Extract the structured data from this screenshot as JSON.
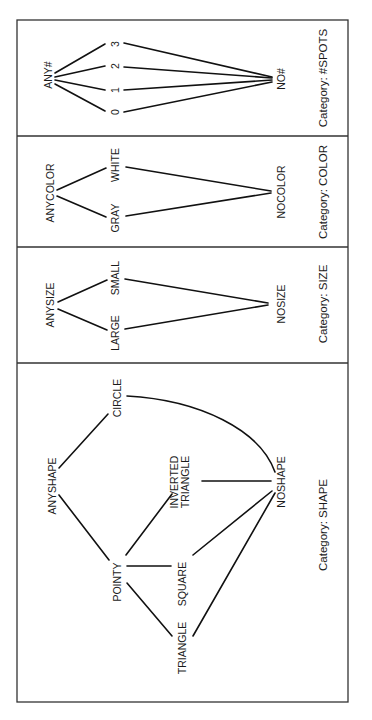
{
  "diagram": {
    "title": "",
    "frame": {
      "x": 17,
      "y": 20,
      "width": 331,
      "height": 682,
      "stroke": "#333333"
    },
    "dividers_y": [
      136,
      247,
      363
    ],
    "panels": [
      {
        "id": "spots",
        "category_label": "Category: #SPOTS",
        "category_pos": {
          "x": 323,
          "y": 78
        },
        "nodes": [
          {
            "id": "any",
            "label": "ANY#",
            "x": 48,
            "y": 75
          },
          {
            "id": "s3",
            "label": "3",
            "x": 115,
            "y": 44
          },
          {
            "id": "s2",
            "label": "2",
            "x": 115,
            "y": 66
          },
          {
            "id": "s1",
            "label": "1",
            "x": 115,
            "y": 90
          },
          {
            "id": "s0",
            "label": "0",
            "x": 115,
            "y": 112
          },
          {
            "id": "no",
            "label": "NO#",
            "x": 281,
            "y": 79
          }
        ],
        "edges": [
          {
            "from": "ANY#",
            "to": "3",
            "x1": 55,
            "y1": 73,
            "x2": 105,
            "y2": 44
          },
          {
            "from": "ANY#",
            "to": "2",
            "x1": 55,
            "y1": 77,
            "x2": 105,
            "y2": 66
          },
          {
            "from": "ANY#",
            "to": "1",
            "x1": 55,
            "y1": 80,
            "x2": 105,
            "y2": 90
          },
          {
            "from": "ANY#",
            "to": "0",
            "x1": 55,
            "y1": 84,
            "x2": 105,
            "y2": 111
          },
          {
            "from": "3",
            "to": "NO#",
            "x1": 124,
            "y1": 43,
            "x2": 272,
            "y2": 77
          },
          {
            "from": "2",
            "to": "NO#",
            "x1": 124,
            "y1": 67,
            "x2": 272,
            "y2": 78
          },
          {
            "from": "1",
            "to": "NO#",
            "x1": 124,
            "y1": 90,
            "x2": 272,
            "y2": 80
          },
          {
            "from": "0",
            "to": "NO#",
            "x1": 124,
            "y1": 112,
            "x2": 272,
            "y2": 82
          }
        ]
      },
      {
        "id": "color",
        "category_label": "Category: COLOR",
        "category_pos": {
          "x": 323,
          "y": 192
        },
        "nodes": [
          {
            "id": "any",
            "label": "ANYCOLOR",
            "x": 50,
            "y": 193
          },
          {
            "id": "white",
            "label": "WHITE",
            "x": 115,
            "y": 165
          },
          {
            "id": "gray",
            "label": "GRAY",
            "x": 115,
            "y": 218
          },
          {
            "id": "no",
            "label": "NOCOLOR",
            "x": 281,
            "y": 192
          }
        ],
        "edges": [
          {
            "from": "ANYCOLOR",
            "to": "WHITE",
            "x1": 57,
            "y1": 190,
            "x2": 106,
            "y2": 168
          },
          {
            "from": "ANYCOLOR",
            "to": "GRAY",
            "x1": 57,
            "y1": 196,
            "x2": 106,
            "y2": 217
          },
          {
            "from": "WHITE",
            "to": "NOCOLOR",
            "x1": 126,
            "y1": 167,
            "x2": 271,
            "y2": 191
          },
          {
            "from": "GRAY",
            "to": "NOCOLOR",
            "x1": 126,
            "y1": 216,
            "x2": 271,
            "y2": 193
          }
        ]
      },
      {
        "id": "size",
        "category_label": "Category: SIZE",
        "category_pos": {
          "x": 323,
          "y": 304
        },
        "nodes": [
          {
            "id": "any",
            "label": "ANYSIZE",
            "x": 50,
            "y": 305
          },
          {
            "id": "small",
            "label": "SMALL",
            "x": 115,
            "y": 278
          },
          {
            "id": "large",
            "label": "LARGE",
            "x": 115,
            "y": 333
          },
          {
            "id": "no",
            "label": "NOSIZE",
            "x": 281,
            "y": 304
          }
        ],
        "edges": [
          {
            "from": "ANYSIZE",
            "to": "SMALL",
            "x1": 58,
            "y1": 302,
            "x2": 107,
            "y2": 280
          },
          {
            "from": "ANYSIZE",
            "to": "LARGE",
            "x1": 58,
            "y1": 309,
            "x2": 107,
            "y2": 330
          },
          {
            "from": "SMALL",
            "to": "NOSIZE",
            "x1": 125,
            "y1": 279,
            "x2": 268,
            "y2": 303
          },
          {
            "from": "LARGE",
            "to": "NOSIZE",
            "x1": 125,
            "y1": 329,
            "x2": 268,
            "y2": 305
          }
        ]
      },
      {
        "id": "shape",
        "category_label": "Category: SHAPE",
        "category_pos": {
          "x": 323,
          "y": 525
        },
        "nodes": [
          {
            "id": "circle",
            "label": "CIRCLE",
            "x": 117,
            "y": 398
          },
          {
            "id": "any",
            "label": "ANYSHAPE",
            "x": 52,
            "y": 486
          },
          {
            "id": "inverted",
            "label": "INVERTED",
            "label2": "TRIANGLE",
            "x": 180,
            "y": 482
          },
          {
            "id": "no",
            "label": "NOSHAPE",
            "x": 281,
            "y": 482
          },
          {
            "id": "pointy",
            "label": "POINTY",
            "x": 117,
            "y": 582
          },
          {
            "id": "square",
            "label": "SQUARE",
            "x": 182,
            "y": 584
          },
          {
            "id": "triangle",
            "label": "TRIANGLE",
            "x": 182,
            "y": 648
          }
        ],
        "edges": [
          {
            "from": "ANYSHAPE",
            "to": "CIRCLE",
            "x1": 59,
            "y1": 468,
            "x2": 108,
            "y2": 414
          },
          {
            "from": "ANYSHAPE",
            "to": "POINTY",
            "x1": 59,
            "y1": 495,
            "x2": 109,
            "y2": 560
          },
          {
            "from": "POINTY",
            "to": "INVERTED TRIANGLE",
            "x1": 126,
            "y1": 555,
            "x2": 172,
            "y2": 494
          },
          {
            "from": "POINTY",
            "to": "SQUARE",
            "x1": 127,
            "y1": 566,
            "x2": 171,
            "y2": 566
          },
          {
            "from": "POINTY",
            "to": "TRIANGLE",
            "x1": 127,
            "y1": 583,
            "x2": 172,
            "y2": 636
          },
          {
            "from": "INVERTED TRIANGLE",
            "to": "NOSHAPE",
            "x1": 202,
            "y1": 481,
            "x2": 271,
            "y2": 481
          },
          {
            "from": "SQUARE",
            "to": "NOSHAPE",
            "x1": 193,
            "y1": 555,
            "x2": 272,
            "y2": 491
          },
          {
            "from": "TRIANGLE",
            "to": "NOSHAPE",
            "x1": 193,
            "y1": 636,
            "x2": 275,
            "y2": 493
          }
        ],
        "curves": [
          {
            "from": "CIRCLE",
            "to": "NOSHAPE",
            "d": "M 127 396 C 200 400, 260 430, 275 472"
          }
        ]
      }
    ]
  }
}
